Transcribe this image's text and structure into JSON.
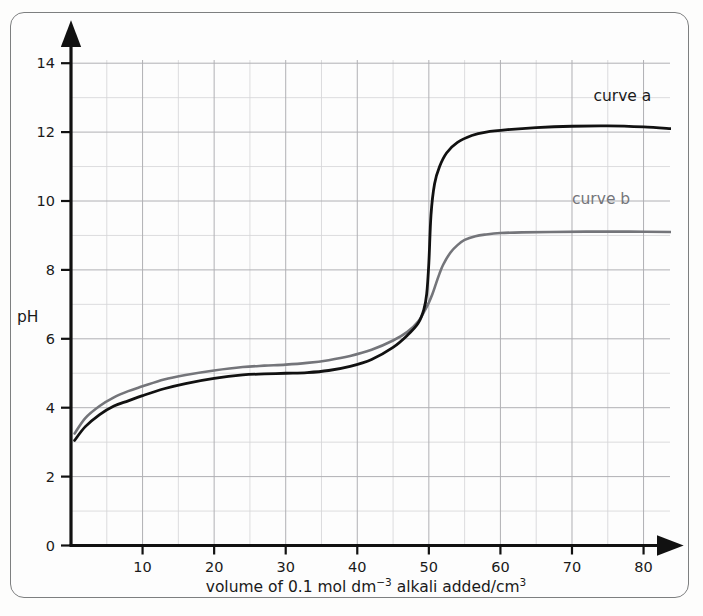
{
  "chart_data": {
    "type": "line",
    "title": "",
    "xlabel": "volume of 0.1 mol dm⁻³ alkali added/cm³",
    "xlabel_parts": {
      "seg1": "volume of 0.1 mol dm",
      "sup1": "−3",
      "seg2": " alkali added/cm",
      "sup2": "3"
    },
    "ylabel": "pH",
    "xlim": [
      0,
      85
    ],
    "ylim": [
      0,
      15
    ],
    "xticks": [
      10,
      20,
      30,
      40,
      50,
      60,
      70,
      80
    ],
    "xtick_labels": [
      "10",
      "20",
      "30",
      "40",
      "50",
      "60",
      "70",
      "80"
    ],
    "yticks": [
      0,
      2,
      4,
      6,
      8,
      10,
      12,
      14
    ],
    "ytick_labels": [
      "0",
      "2",
      "4",
      "6",
      "8",
      "10",
      "12",
      "14"
    ],
    "grid": true,
    "grid_x_step": 5,
    "grid_y_step": 1,
    "legend_position": "inline-right",
    "series": [
      {
        "name": "curve a",
        "label": "curve a",
        "color": "#111111",
        "equivalence_volume": 50,
        "start_ph": 3.05,
        "plateau_ph": 12.1,
        "x": [
          0.5,
          2,
          4,
          6,
          8,
          10,
          13,
          16,
          20,
          24,
          27,
          30,
          33,
          36,
          39,
          42,
          45,
          47,
          48.5,
          49.3,
          49.7,
          50,
          50.3,
          50.8,
          51.5,
          52.5,
          54,
          56,
          58,
          61,
          65,
          70,
          75,
          80,
          84
        ],
        "y": [
          3.05,
          3.45,
          3.8,
          4.05,
          4.2,
          4.35,
          4.55,
          4.7,
          4.85,
          4.95,
          4.98,
          5.0,
          5.02,
          5.08,
          5.2,
          5.4,
          5.75,
          6.1,
          6.45,
          6.85,
          7.3,
          8.2,
          9.6,
          10.5,
          11.0,
          11.4,
          11.7,
          11.9,
          12.0,
          12.07,
          12.13,
          12.17,
          12.18,
          12.15,
          12.1
        ]
      },
      {
        "name": "curve b",
        "label": "curve b",
        "color": "#74757a",
        "equivalence_volume": 51,
        "start_ph": 3.25,
        "plateau_ph": 9.1,
        "x": [
          0.5,
          2,
          4,
          6,
          8,
          10,
          13,
          16,
          20,
          24,
          27,
          30,
          33,
          36,
          39,
          42,
          45,
          47,
          48.5,
          49.5,
          50,
          50.5,
          51,
          51.5,
          52,
          53,
          54,
          55,
          56.5,
          58,
          60,
          63,
          67,
          72,
          78,
          84
        ],
        "y": [
          3.25,
          3.7,
          4.05,
          4.3,
          4.48,
          4.62,
          4.82,
          4.95,
          5.08,
          5.18,
          5.22,
          5.25,
          5.3,
          5.38,
          5.5,
          5.68,
          5.95,
          6.2,
          6.5,
          6.85,
          7.05,
          7.3,
          7.6,
          7.9,
          8.15,
          8.5,
          8.72,
          8.87,
          8.98,
          9.03,
          9.07,
          9.09,
          9.1,
          9.11,
          9.11,
          9.1
        ]
      }
    ],
    "annotations": [
      {
        "name": "curve-a-label",
        "text": "curve a",
        "x": 73,
        "y": 12.9
      },
      {
        "name": "curve-b-label",
        "text": "curve b",
        "x": 70,
        "y": 9.9
      }
    ],
    "colors": {
      "curve_a": "#111111",
      "curve_b": "#74757a",
      "axis": "#111111",
      "grid_minor": "#d6d6d8",
      "grid_major": "#b0b0b4",
      "frame": "#7d7f80",
      "background": "#fdfdfd"
    }
  }
}
